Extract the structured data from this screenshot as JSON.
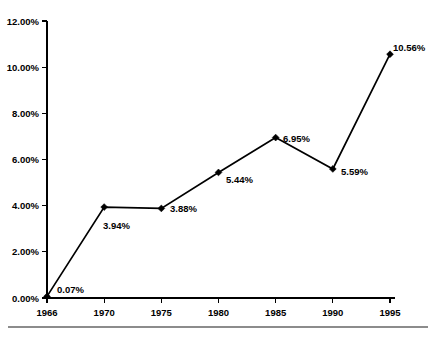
{
  "chart_data": {
    "type": "line",
    "title": "",
    "subtitle": "",
    "xlabel": "",
    "ylabel": "",
    "categories": [
      "1966",
      "1970",
      "1975",
      "1980",
      "1985",
      "1990",
      "1995"
    ],
    "values": [
      0.07,
      3.94,
      3.88,
      5.44,
      6.95,
      5.59,
      10.56
    ],
    "point_labels": [
      "0.07%",
      "3.94%",
      "3.88%",
      "5.44%",
      "6.95%",
      "5.59%",
      "10.56%"
    ],
    "ylim": [
      0,
      12
    ],
    "ytick_values": [
      0,
      2,
      4,
      6,
      8,
      10,
      12
    ],
    "ytick_labels": [
      "0.00%",
      "2.00%",
      "4.00%",
      "6.00%",
      "8.00%",
      "10.00%",
      "12.00%"
    ],
    "xtick_labels": [
      "1966",
      "1970",
      "1975",
      "1980",
      "1985",
      "1990",
      "1995"
    ],
    "grid": false,
    "legend": "none",
    "series": [
      {
        "name": "",
        "values": [
          0.07,
          3.94,
          3.88,
          5.44,
          6.95,
          5.59,
          10.56
        ],
        "color": "#000000",
        "marker": "diamond"
      }
    ],
    "colors": {
      "line": "#000000",
      "marker": "#000000",
      "axis": "#000000",
      "text": "#000000",
      "background": "#ffffff",
      "footer_rule": "#8c8c8c"
    }
  },
  "footer": {
    "rule_present": "true"
  }
}
